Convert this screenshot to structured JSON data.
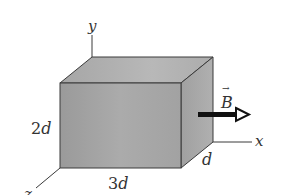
{
  "figure": {
    "type": "3D rectangular box in magnetic field",
    "colors": {
      "background": "#ffffff",
      "front_face": "#a8a8a8",
      "top_face": "#b4b4b4",
      "side_face": "#9c9c9c",
      "edges": "#3a3a3a",
      "arrow": "#111111",
      "text": "#333333"
    },
    "axes": {
      "x_label": "x",
      "y_label": "y",
      "z_label": "z"
    },
    "dimensions": {
      "height_label_coef": "2",
      "height_label_var": "d",
      "width_label_coef": "3",
      "width_label_var": "d",
      "depth_label": "d"
    },
    "field": {
      "label": "B",
      "vector_mark": "→",
      "direction": "+x"
    }
  }
}
